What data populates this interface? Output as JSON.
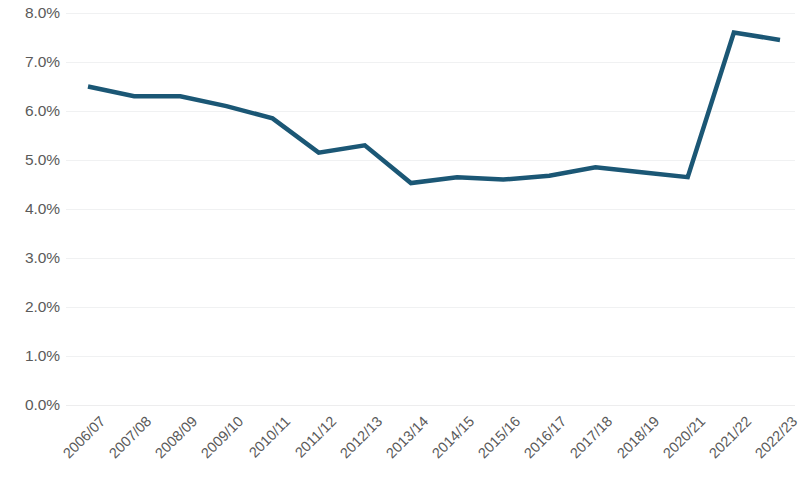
{
  "chart_data": {
    "type": "line",
    "title": "",
    "subtitle": "",
    "xlabel": "",
    "ylabel": "",
    "grid": true,
    "legend": "none",
    "ylim": [
      0.0,
      8.0
    ],
    "ytick_step": 1.0,
    "ytick_labels": [
      "8.0%",
      "7.0%",
      "6.0%",
      "5.0%",
      "4.0%",
      "3.0%",
      "2.0%",
      "1.0%",
      "0.0%"
    ],
    "ytick_values": [
      8.0,
      7.0,
      6.0,
      5.0,
      4.0,
      3.0,
      2.0,
      1.0,
      0.0
    ],
    "categories": [
      "2006/07",
      "2007/08",
      "2008/09",
      "2009/10",
      "2010/11",
      "2011/12",
      "2012/13",
      "2013/14",
      "2014/15",
      "2015/16",
      "2016/17",
      "2017/18",
      "2018/19",
      "2020/21",
      "2021/22",
      "2022/23"
    ],
    "values": [
      6.5,
      6.3,
      6.3,
      6.1,
      5.85,
      5.15,
      5.3,
      4.53,
      4.65,
      4.6,
      4.68,
      4.85,
      4.75,
      4.65,
      7.6,
      7.45
    ],
    "series": [
      {
        "name": "Rate",
        "color": "#1b5775",
        "values": [
          6.5,
          6.3,
          6.3,
          6.1,
          5.85,
          5.15,
          5.3,
          4.53,
          4.65,
          4.6,
          4.68,
          4.85,
          4.75,
          4.65,
          7.6,
          7.45
        ]
      }
    ],
    "colors": {
      "line": "#1b5775",
      "grid": "#f0f1f2",
      "text": "#5a5a5a",
      "background": "#ffffff"
    },
    "line_width": 4.5
  }
}
